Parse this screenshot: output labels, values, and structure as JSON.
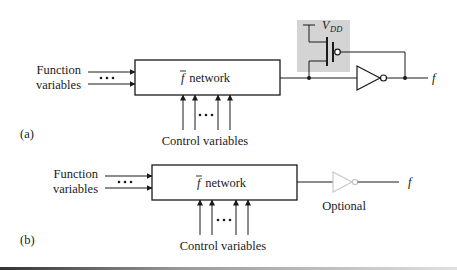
{
  "diagram_a": {
    "label": "(a)",
    "function_label_line1": "Function",
    "function_label_line2": "variables",
    "network_label_f": "f",
    "network_label_rest": " network",
    "control_label": "Control variables",
    "vdd_label_v": "V",
    "vdd_label_sub": "DD",
    "output_label": "f",
    "ellipsis": "• • •"
  },
  "diagram_b": {
    "label": "(b)",
    "function_label_line1": "Function",
    "function_label_line2": "variables",
    "network_label_f": "f",
    "network_label_rest": " network",
    "control_label": "Control variables",
    "optional_label": "Optional",
    "output_label": "f",
    "ellipsis": "• • •"
  },
  "colors": {
    "line": "#1a1a1a",
    "pmos_highlight": "#d4d4d4",
    "optional_gate": "#c8c8c8"
  }
}
